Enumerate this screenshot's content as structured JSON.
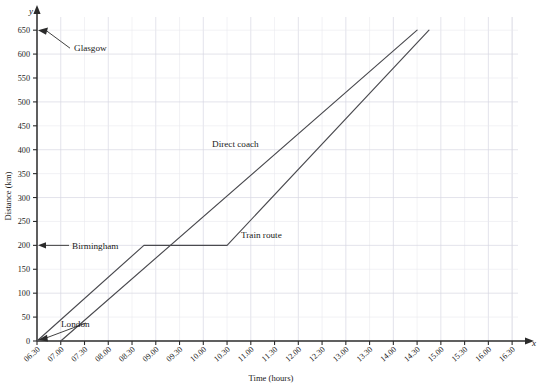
{
  "chart_data": {
    "type": "line",
    "title": "",
    "xlabel": "Time (hours)",
    "ylabel": "Distance (km)",
    "x_axis_letter": "x",
    "y_axis_letter": "y",
    "grid": true,
    "legend_position": "inline-annotations",
    "ylim": [
      0,
      665
    ],
    "yticks": [
      0,
      50,
      100,
      150,
      200,
      250,
      300,
      350,
      400,
      450,
      500,
      550,
      600,
      650
    ],
    "ytick_labels": [
      "0",
      "50",
      "100",
      "150",
      "200",
      "250",
      "300",
      "350",
      "400",
      "450",
      "500",
      "550",
      "600",
      "650"
    ],
    "xlim_hours": [
      6.5,
      16.75
    ],
    "xticks_hours": [
      6.5,
      7.0,
      7.5,
      8.0,
      8.5,
      9.0,
      9.5,
      10.0,
      10.5,
      11.0,
      11.5,
      12.0,
      12.5,
      13.0,
      13.5,
      14.0,
      14.5,
      15.0,
      15.5,
      16.0,
      16.5
    ],
    "xtick_labels": [
      "06.30",
      "07.00",
      "07.30",
      "08.00",
      "08.30",
      "09.00",
      "09.30",
      "10.00",
      "10.30",
      "11.00",
      "11.30",
      "12.00",
      "12.30",
      "13.00",
      "13.30",
      "14.00",
      "14.30",
      "15.00",
      "15.30",
      "16.00",
      "16.30"
    ],
    "series": [
      {
        "name": "Train route",
        "label": "Train route",
        "color": "#4a4a4f",
        "points": [
          {
            "x": 6.5,
            "y": 0,
            "time": "06.30"
          },
          {
            "x": 8.75,
            "y": 200,
            "time": "08.45"
          },
          {
            "x": 10.5,
            "y": 200,
            "time": "10.30"
          },
          {
            "x": 14.75,
            "y": 650,
            "time": "14.45"
          }
        ]
      },
      {
        "name": "Direct coach",
        "label": "Direct coach",
        "color": "#4a4a4f",
        "points": [
          {
            "x": 7.0,
            "y": 0,
            "time": "07.00"
          },
          {
            "x": 14.5,
            "y": 650,
            "time": "14.30"
          }
        ]
      }
    ],
    "annotations": [
      {
        "name": "glasgow",
        "text": "Glasgow",
        "target_y": 650,
        "target_x": 6.5
      },
      {
        "name": "birmingham",
        "text": "Birmingham",
        "target_y": 200,
        "target_x": 6.5
      },
      {
        "name": "london",
        "text": "London",
        "target_y": 0,
        "target_x": 6.5
      },
      {
        "name": "direct-coach",
        "text": "Direct coach"
      },
      {
        "name": "train-route",
        "text": "Train route"
      }
    ]
  }
}
